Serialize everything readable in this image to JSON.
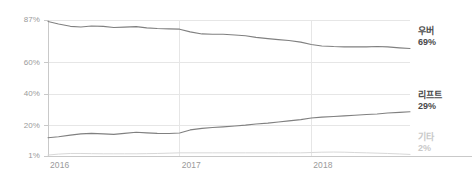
{
  "chart_data": {
    "type": "line",
    "title": "",
    "subtitle": "",
    "xlabel": "",
    "ylabel": "",
    "grid": true,
    "legend_position": "right",
    "ylim": [
      1,
      87
    ],
    "y_ticks": [
      "87%",
      "60%",
      "40%",
      "20%",
      "1%"
    ],
    "y_tick_values": [
      87,
      60,
      40,
      20,
      1
    ],
    "x_ticks": [
      "2016",
      "2017",
      "2018"
    ],
    "x_tick_values": [
      2016,
      2017,
      2018
    ],
    "xlim": [
      2016,
      2018.75
    ],
    "series": [
      {
        "name": "우버",
        "end_label": "우버",
        "end_value": "69%",
        "color": "#808080",
        "x": [
          2016.0,
          2016.08,
          2016.17,
          2016.25,
          2016.33,
          2016.42,
          2016.5,
          2016.58,
          2016.67,
          2016.75,
          2016.83,
          2016.92,
          2017.0,
          2017.08,
          2017.17,
          2017.25,
          2017.33,
          2017.42,
          2017.5,
          2017.58,
          2017.67,
          2017.75,
          2017.83,
          2017.92,
          2018.0,
          2018.08,
          2018.17,
          2018.25,
          2018.33,
          2018.42,
          2018.5,
          2018.58,
          2018.67,
          2018.75
        ],
        "values": [
          86.0,
          84.5,
          83.0,
          82.6,
          83.2,
          83.0,
          82.3,
          82.5,
          82.8,
          82.0,
          81.6,
          81.4,
          81.2,
          79.5,
          78.2,
          78.0,
          78.0,
          77.5,
          77.0,
          76.0,
          75.2,
          74.6,
          74.0,
          73.0,
          71.5,
          70.6,
          70.2,
          70.0,
          70.0,
          70.0,
          70.2,
          70.0,
          69.4,
          69.0
        ]
      },
      {
        "name": "리프트",
        "end_label": "리프트",
        "end_value": "29%",
        "color": "#808080",
        "x": [
          2016.0,
          2016.08,
          2016.17,
          2016.25,
          2016.33,
          2016.42,
          2016.5,
          2016.58,
          2016.67,
          2016.75,
          2016.83,
          2016.92,
          2017.0,
          2017.08,
          2017.17,
          2017.25,
          2017.33,
          2017.42,
          2017.5,
          2017.58,
          2017.67,
          2017.75,
          2017.83,
          2017.92,
          2018.0,
          2018.08,
          2018.17,
          2018.25,
          2018.33,
          2018.42,
          2018.5,
          2018.58,
          2018.67,
          2018.75
        ],
        "values": [
          12.5,
          13.2,
          14.2,
          15.0,
          15.3,
          15.0,
          14.7,
          15.3,
          16.0,
          15.6,
          15.3,
          15.2,
          15.5,
          17.5,
          18.5,
          19.0,
          19.4,
          20.0,
          20.5,
          21.2,
          21.8,
          22.5,
          23.2,
          24.0,
          25.0,
          25.6,
          26.0,
          26.4,
          26.8,
          27.2,
          27.6,
          28.2,
          28.6,
          29.0
        ]
      },
      {
        "name": "기타",
        "end_label": "기타",
        "end_value": "2%",
        "color": "#d8d8d8",
        "x": [
          2016.0,
          2016.08,
          2016.17,
          2016.25,
          2016.33,
          2016.42,
          2016.5,
          2016.58,
          2016.67,
          2016.75,
          2016.83,
          2016.92,
          2017.0,
          2017.08,
          2017.17,
          2017.25,
          2017.33,
          2017.42,
          2017.5,
          2017.58,
          2017.67,
          2017.75,
          2017.83,
          2017.92,
          2018.0,
          2018.08,
          2018.17,
          2018.25,
          2018.33,
          2018.42,
          2018.5,
          2018.58,
          2018.67,
          2018.75
        ],
        "values": [
          1.6,
          2.2,
          2.6,
          2.6,
          2.5,
          2.4,
          2.4,
          2.4,
          2.4,
          2.5,
          2.6,
          2.8,
          3.0,
          3.0,
          3.0,
          3.0,
          3.0,
          3.0,
          3.0,
          3.0,
          3.0,
          3.0,
          3.0,
          3.0,
          3.2,
          3.4,
          3.5,
          3.4,
          3.2,
          3.0,
          2.8,
          2.6,
          2.3,
          2.0
        ]
      }
    ],
    "colors": {
      "axis": "#c9c9c9",
      "grid": "#e6e6e6",
      "tick_text": "#9a9a9a",
      "line_primary": "#808080",
      "line_faint": "#d8d8d8",
      "label_dark": "#4a4a4a",
      "label_faint": "#c9c9c9"
    }
  }
}
